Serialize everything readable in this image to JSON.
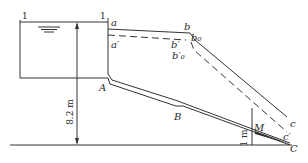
{
  "diagram": {
    "type": "pipe-flow energy and hydraulic grade line diagram",
    "section_labels": {
      "left": "1",
      "right": "1"
    },
    "points": {
      "a": "a",
      "a_prime": "a′",
      "b": "b",
      "b0": "b₀",
      "b_prime": "b′",
      "b0_prime": "b′₀",
      "c": "c",
      "c_prime": "c′",
      "A": "A",
      "B": "B",
      "C": "C",
      "M": "M"
    },
    "dimensions": {
      "height": "8.2 m",
      "m_height": "1 m"
    },
    "colors": {
      "stroke": "#333333",
      "background": "#ffffff"
    }
  }
}
